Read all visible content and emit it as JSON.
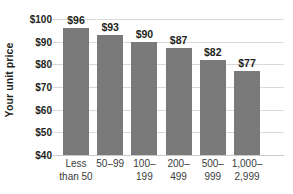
{
  "chart_data": {
    "type": "bar",
    "title": "",
    "subtitle": "",
    "xlabel": "",
    "ylabel": "Your unit price",
    "categories": [
      "Less\nthan 50",
      "50–99",
      "100–\n199",
      "200–\n499",
      "500–\n999",
      "1,000–\n2,999"
    ],
    "values": [
      96,
      93,
      90,
      87,
      82,
      77
    ],
    "value_labels": [
      "$96",
      "$93",
      "$90",
      "$87",
      "$82",
      "$77"
    ],
    "ylim": [
      40,
      100
    ],
    "yticks": [
      100,
      90,
      80,
      70,
      60,
      50,
      40
    ],
    "ytick_labels": [
      "$100",
      "$90",
      "$80",
      "$70",
      "$60",
      "$50",
      "$40"
    ],
    "grid": true,
    "legend": false,
    "legend_position": "none",
    "bar_color": "#7a7a7a",
    "grid_color": "#d9d9d9",
    "text_color": "#231f20",
    "background_color": "#ffffff"
  }
}
